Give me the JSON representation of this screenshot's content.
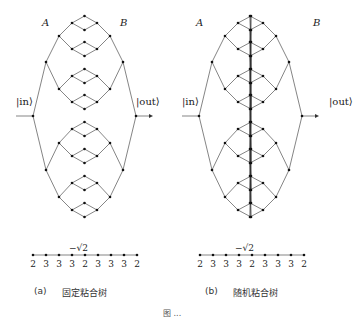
{
  "panels": [
    {
      "id": "a",
      "label_A": "A",
      "label_B": "B",
      "label_in": "|in⟩",
      "label_out": "|out⟩",
      "chain_weight": "−√2",
      "chain_values": [
        "2",
        "3",
        "3",
        "3",
        "2",
        "3",
        "3",
        "3",
        "2"
      ],
      "caption_tag": "(a)",
      "caption_text": "固定粘合树"
    },
    {
      "id": "b",
      "label_A": "A",
      "label_B": "B",
      "label_in": "|in⟩",
      "label_out": "|out⟩",
      "chain_weight": "−√2",
      "chain_values": [
        "2",
        "3",
        "3",
        "3",
        "2",
        "3",
        "3",
        "3",
        "2"
      ],
      "caption_tag": "(b)",
      "caption_text": "随机粘合树"
    }
  ],
  "figure_caption": "图 ..."
}
